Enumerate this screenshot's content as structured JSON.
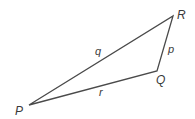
{
  "diagram": {
    "type": "triangle",
    "stroke_color": "#4a4a4a",
    "vertices": [
      {
        "name": "P",
        "x": 29,
        "y": 105,
        "label_x": 15,
        "label_y": 115
      },
      {
        "name": "Q",
        "x": 157,
        "y": 71,
        "label_x": 156,
        "label_y": 84
      },
      {
        "name": "R",
        "x": 173,
        "y": 16,
        "label_x": 177,
        "label_y": 19
      }
    ],
    "sides": [
      {
        "name": "q",
        "from": "P",
        "to": "R",
        "label_x": 95,
        "label_y": 55
      },
      {
        "name": "p",
        "from": "R",
        "to": "Q",
        "label_x": 168,
        "label_y": 53
      },
      {
        "name": "r",
        "from": "P",
        "to": "Q",
        "label_x": 99,
        "label_y": 96
      }
    ]
  }
}
